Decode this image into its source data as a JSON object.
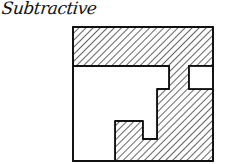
{
  "title": "Subtractive",
  "diagram": {
    "type": "hand-drawn architectural form diagram",
    "stroke_color": "#111111",
    "background": "#ffffff",
    "hatch": "diagonal lines",
    "outer_square": {
      "x": 73,
      "y": 27,
      "w": 140,
      "h": 134
    }
  }
}
